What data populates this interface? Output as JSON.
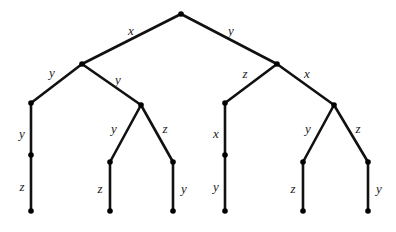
{
  "diagram": {
    "type": "binary-tree",
    "title": "",
    "stroke_color": "#111111",
    "node_color": "#000000",
    "background_color": "#ffffff",
    "label_color": "#1a1a1a",
    "nodes": [
      {
        "id": "root",
        "x": 181,
        "y": 14,
        "kind": "internal"
      },
      {
        "id": "n-l",
        "x": 82,
        "y": 64,
        "kind": "internal"
      },
      {
        "id": "n-r",
        "x": 277,
        "y": 64,
        "kind": "internal"
      },
      {
        "id": "n-ll",
        "x": 31,
        "y": 103,
        "kind": "internal"
      },
      {
        "id": "n-lr",
        "x": 141,
        "y": 105,
        "kind": "internal"
      },
      {
        "id": "n-rl",
        "x": 225,
        "y": 103,
        "kind": "internal"
      },
      {
        "id": "n-rr",
        "x": 334,
        "y": 105,
        "kind": "internal"
      },
      {
        "id": "n-ll2",
        "x": 31,
        "y": 155,
        "kind": "internal"
      },
      {
        "id": "n-rl2",
        "x": 225,
        "y": 155,
        "kind": "internal"
      },
      {
        "id": "n-lrl",
        "x": 110,
        "y": 162,
        "kind": "internal"
      },
      {
        "id": "n-lrr",
        "x": 173,
        "y": 162,
        "kind": "internal"
      },
      {
        "id": "n-rrl",
        "x": 303,
        "y": 162,
        "kind": "internal"
      },
      {
        "id": "n-rrr",
        "x": 368,
        "y": 162,
        "kind": "internal"
      },
      {
        "id": "leaf-1",
        "x": 31,
        "y": 211,
        "kind": "leaf"
      },
      {
        "id": "leaf-2",
        "x": 110,
        "y": 211,
        "kind": "leaf"
      },
      {
        "id": "leaf-3",
        "x": 173,
        "y": 211,
        "kind": "leaf"
      },
      {
        "id": "leaf-4",
        "x": 225,
        "y": 211,
        "kind": "leaf"
      },
      {
        "id": "leaf-5",
        "x": 303,
        "y": 211,
        "kind": "leaf"
      },
      {
        "id": "leaf-6",
        "x": 368,
        "y": 211,
        "kind": "leaf"
      }
    ],
    "edges": [
      {
        "id": "e1",
        "from": "root",
        "to": "n-l",
        "label": "x",
        "label_x": 131,
        "label_y": 30
      },
      {
        "id": "e2",
        "from": "root",
        "to": "n-r",
        "label": "y",
        "label_x": 231,
        "label_y": 30
      },
      {
        "id": "e3",
        "from": "n-l",
        "to": "n-ll",
        "label": "y",
        "label_x": 52,
        "label_y": 72
      },
      {
        "id": "e4",
        "from": "n-l",
        "to": "n-lr",
        "label": "y",
        "label_x": 118,
        "label_y": 79
      },
      {
        "id": "e5",
        "from": "n-r",
        "to": "n-rl",
        "label": "z",
        "label_x": 245,
        "label_y": 73
      },
      {
        "id": "e6",
        "from": "n-r",
        "to": "n-rr",
        "label": "x",
        "label_x": 307,
        "label_y": 73
      },
      {
        "id": "e7",
        "from": "n-ll",
        "to": "n-ll2",
        "label": "y",
        "label_x": 22,
        "label_y": 133
      },
      {
        "id": "e8",
        "from": "n-ll2",
        "to": "leaf-1",
        "label": "z",
        "label_x": 22,
        "label_y": 186
      },
      {
        "id": "e9",
        "from": "n-lr",
        "to": "n-lrl",
        "label": "y",
        "label_x": 114,
        "label_y": 128
      },
      {
        "id": "e10",
        "from": "n-lr",
        "to": "n-lrr",
        "label": "z",
        "label_x": 165,
        "label_y": 128
      },
      {
        "id": "e11",
        "from": "n-lrl",
        "to": "leaf-2",
        "label": "z",
        "label_x": 100,
        "label_y": 188
      },
      {
        "id": "e12",
        "from": "n-lrr",
        "to": "leaf-3",
        "label": "y",
        "label_x": 184,
        "label_y": 188
      },
      {
        "id": "e13",
        "from": "n-rl",
        "to": "n-rl2",
        "label": "x",
        "label_x": 216,
        "label_y": 133
      },
      {
        "id": "e14",
        "from": "n-rl2",
        "to": "leaf-4",
        "label": "y",
        "label_x": 216,
        "label_y": 186
      },
      {
        "id": "e15",
        "from": "n-rr",
        "to": "n-rrl",
        "label": "y",
        "label_x": 308,
        "label_y": 128
      },
      {
        "id": "e16",
        "from": "n-rr",
        "to": "n-rrr",
        "label": "z",
        "label_x": 358,
        "label_y": 128
      },
      {
        "id": "e17",
        "from": "n-rrl",
        "to": "leaf-5",
        "label": "z",
        "label_x": 293,
        "label_y": 188
      },
      {
        "id": "e18",
        "from": "n-rrr",
        "to": "leaf-6",
        "label": "y",
        "label_x": 379,
        "label_y": 188
      }
    ]
  }
}
